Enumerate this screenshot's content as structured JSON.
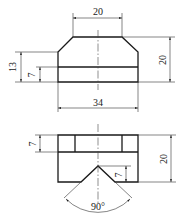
{
  "drawing": {
    "type": "orthographic-technical-drawing",
    "views": [
      {
        "name": "front-view",
        "shape": "chamfered block",
        "dimensions": {
          "top_width": "20",
          "total_height": "20",
          "left_height": "13",
          "lower_band_height": "7",
          "bottom_width": "34"
        }
      },
      {
        "name": "top-view",
        "shape": "block with V-notch",
        "dimensions": {
          "upper_band_height": "7",
          "total_height": "20",
          "notch_depth": "7",
          "notch_angle": "90°"
        }
      }
    ]
  },
  "labels": {
    "front_top_width": "20",
    "front_total_height": "20",
    "front_left_height": "13",
    "front_band_height": "7",
    "front_bottom_width": "34",
    "top_band_height": "7",
    "top_total_height": "20",
    "top_notch_depth": "7",
    "top_notch_angle": "90°"
  },
  "colors": {
    "line": "#1a1a1a",
    "background": "#ffffff"
  }
}
